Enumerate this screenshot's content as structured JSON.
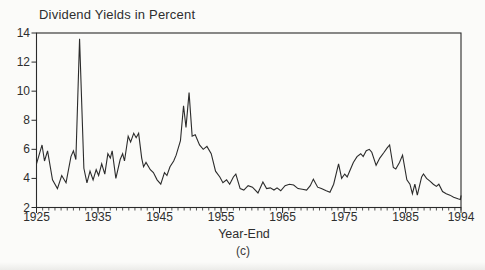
{
  "page": {
    "background": "#fbfbf9",
    "line_color": "#2b2b2b",
    "text_color": "#2e2e2e"
  },
  "chart_data": {
    "type": "line",
    "title": "Dividend Yields in Percent",
    "xlabel": "Year-End",
    "caption": "(c)",
    "legend": "none",
    "grid": "off",
    "x_range": [
      1925,
      1994
    ],
    "y_range": [
      2,
      14
    ],
    "y_ticks": [
      14,
      12,
      10,
      8,
      6,
      4,
      2
    ],
    "x_major_ticks": [
      1925,
      1935,
      1945,
      1955,
      1965,
      1975,
      1985,
      1994
    ],
    "x_minor_tick_interval_years": 1,
    "series": [
      {
        "name": "dividend_yield_percent",
        "points": [
          [
            1925.0,
            5.0
          ],
          [
            1925.9,
            6.3
          ],
          [
            1926.3,
            5.2
          ],
          [
            1926.8,
            5.9
          ],
          [
            1927.6,
            3.9
          ],
          [
            1928.4,
            3.3
          ],
          [
            1929.1,
            4.2
          ],
          [
            1929.8,
            3.7
          ],
          [
            1930.6,
            5.5
          ],
          [
            1931.0,
            5.9
          ],
          [
            1931.4,
            5.3
          ],
          [
            1932.0,
            13.6
          ],
          [
            1932.7,
            4.7
          ],
          [
            1933.2,
            3.7
          ],
          [
            1933.7,
            4.5
          ],
          [
            1934.2,
            3.9
          ],
          [
            1934.7,
            4.6
          ],
          [
            1935.1,
            4.2
          ],
          [
            1935.6,
            5.0
          ],
          [
            1936.1,
            4.3
          ],
          [
            1936.6,
            5.7
          ],
          [
            1937.0,
            5.4
          ],
          [
            1937.3,
            5.9
          ],
          [
            1937.9,
            4.0
          ],
          [
            1938.6,
            5.3
          ],
          [
            1939.0,
            5.7
          ],
          [
            1939.3,
            5.2
          ],
          [
            1939.9,
            6.9
          ],
          [
            1940.3,
            6.5
          ],
          [
            1940.8,
            7.1
          ],
          [
            1941.2,
            6.8
          ],
          [
            1941.6,
            7.1
          ],
          [
            1942.1,
            5.4
          ],
          [
            1942.4,
            4.8
          ],
          [
            1942.8,
            5.1
          ],
          [
            1943.5,
            4.6
          ],
          [
            1944.0,
            4.4
          ],
          [
            1944.6,
            3.9
          ],
          [
            1945.2,
            3.6
          ],
          [
            1945.8,
            4.4
          ],
          [
            1946.2,
            4.2
          ],
          [
            1946.7,
            4.8
          ],
          [
            1947.3,
            5.2
          ],
          [
            1947.7,
            5.6
          ],
          [
            1948.4,
            6.6
          ],
          [
            1948.9,
            9.0
          ],
          [
            1949.3,
            7.5
          ],
          [
            1949.8,
            9.9
          ],
          [
            1950.3,
            6.9
          ],
          [
            1950.8,
            7.0
          ],
          [
            1951.5,
            6.3
          ],
          [
            1952.1,
            6.0
          ],
          [
            1952.7,
            6.2
          ],
          [
            1953.4,
            5.7
          ],
          [
            1954.1,
            4.5
          ],
          [
            1954.8,
            4.1
          ],
          [
            1955.3,
            3.7
          ],
          [
            1955.9,
            3.9
          ],
          [
            1956.4,
            3.6
          ],
          [
            1957.0,
            4.1
          ],
          [
            1957.4,
            4.3
          ],
          [
            1958.1,
            3.3
          ],
          [
            1958.7,
            3.2
          ],
          [
            1959.4,
            3.5
          ],
          [
            1960.1,
            3.4
          ],
          [
            1961.0,
            3.0
          ],
          [
            1961.8,
            3.75
          ],
          [
            1962.4,
            3.3
          ],
          [
            1963.0,
            3.35
          ],
          [
            1963.6,
            3.2
          ],
          [
            1964.1,
            3.35
          ],
          [
            1964.7,
            3.15
          ],
          [
            1965.4,
            3.5
          ],
          [
            1966.1,
            3.6
          ],
          [
            1966.8,
            3.55
          ],
          [
            1967.5,
            3.3
          ],
          [
            1968.2,
            3.25
          ],
          [
            1968.9,
            3.2
          ],
          [
            1969.5,
            3.5
          ],
          [
            1970.0,
            3.95
          ],
          [
            1970.7,
            3.4
          ],
          [
            1971.3,
            3.3
          ],
          [
            1972.1,
            3.15
          ],
          [
            1972.7,
            3.05
          ],
          [
            1973.3,
            3.6
          ],
          [
            1974.1,
            5.0
          ],
          [
            1974.6,
            4.0
          ],
          [
            1975.1,
            4.3
          ],
          [
            1975.5,
            4.1
          ],
          [
            1976.0,
            4.6
          ],
          [
            1976.5,
            5.1
          ],
          [
            1977.1,
            5.5
          ],
          [
            1977.7,
            5.7
          ],
          [
            1978.1,
            5.5
          ],
          [
            1978.6,
            5.9
          ],
          [
            1979.1,
            6.0
          ],
          [
            1979.5,
            5.8
          ],
          [
            1980.2,
            4.9
          ],
          [
            1980.8,
            5.4
          ],
          [
            1981.5,
            5.8
          ],
          [
            1982.0,
            6.1
          ],
          [
            1982.4,
            6.3
          ],
          [
            1983.0,
            4.75
          ],
          [
            1983.4,
            4.65
          ],
          [
            1984.0,
            5.1
          ],
          [
            1984.5,
            5.6
          ],
          [
            1985.2,
            3.9
          ],
          [
            1985.7,
            3.6
          ],
          [
            1986.1,
            2.95
          ],
          [
            1986.5,
            3.6
          ],
          [
            1986.9,
            2.85
          ],
          [
            1987.6,
            4.1
          ],
          [
            1987.9,
            4.3
          ],
          [
            1988.4,
            4.0
          ],
          [
            1989.0,
            3.8
          ],
          [
            1989.5,
            3.6
          ],
          [
            1990.0,
            3.45
          ],
          [
            1990.4,
            3.6
          ],
          [
            1991.0,
            3.1
          ],
          [
            1991.6,
            2.95
          ],
          [
            1992.2,
            2.85
          ],
          [
            1992.8,
            2.7
          ],
          [
            1993.5,
            2.6
          ],
          [
            1993.9,
            2.55
          ],
          [
            1994.0,
            2.8
          ]
        ]
      }
    ]
  }
}
